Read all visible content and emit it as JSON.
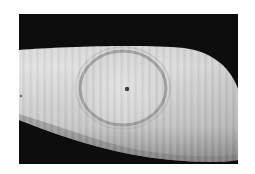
{
  "image": {
    "alt": "Grayscale photograph of a limb with an annular (ring-shaped) skin lesion with a small dark central spot",
    "subject": "annular-skin-lesion",
    "colors": {
      "background": "#0d0d0d",
      "skin_light": "#d9d9d9",
      "skin_mid": "#bdbdbd",
      "skin_shadow": "#7a7a7a",
      "lesion_ring": "#8f8f8f",
      "central_spot": "#3a3a3a",
      "page": "#ffffff"
    }
  }
}
